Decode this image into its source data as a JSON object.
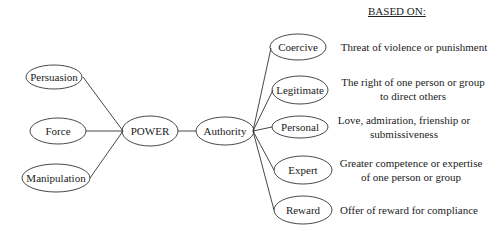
{
  "header": {
    "based_on": "BASED ON:"
  },
  "center": {
    "power": "POWER",
    "authority": "Authority"
  },
  "left_nodes": [
    {
      "label": "Persuasion"
    },
    {
      "label": "Force"
    },
    {
      "label": "Manipulation"
    }
  ],
  "authority_types": [
    {
      "label": "Coercive",
      "description": [
        "Threat of violence or punishment"
      ]
    },
    {
      "label": "Legitimate",
      "description": [
        "The right of one person or group",
        "to direct others"
      ]
    },
    {
      "label": "Personal",
      "description": [
        "Love, admiration, frienship or",
        "submissiveness"
      ]
    },
    {
      "label": "Expert",
      "description": [
        "Greater competence or expertise",
        "of one person or group"
      ]
    },
    {
      "label": "Reward",
      "description": [
        "Offer of reward for compliance"
      ]
    }
  ],
  "colors": {
    "stroke": "#333333",
    "background": "#ffffff"
  }
}
